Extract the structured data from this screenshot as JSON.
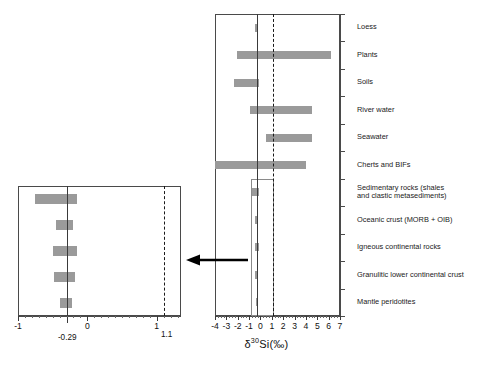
{
  "figure": {
    "axis_title_delta": "δ",
    "axis_title_sup": "30",
    "axis_title_rest": "Si(‰)"
  },
  "main_axis": {
    "ticks": [
      "-4",
      "-3",
      "-2",
      "-1",
      "0",
      "1",
      "2",
      "3",
      "4",
      "5",
      "6",
      "7"
    ],
    "tick_values": [
      -4,
      -3,
      -2,
      -1,
      0,
      1,
      2,
      3,
      4,
      5,
      6,
      7
    ],
    "xmin": -4,
    "xmax": 7,
    "solid_reference": -0.29,
    "dashed_reference": 1.1
  },
  "inset_axis": {
    "ticks": [
      "-1",
      "0",
      "1"
    ],
    "tick_values": [
      -1,
      0,
      1
    ],
    "xmin": -1.0,
    "xmax": 1.35,
    "solid_reference": -0.29,
    "dashed_reference": 1.1,
    "solid_label": "-0.29",
    "dashed_label": "1.1"
  },
  "categories": [
    "Loess",
    "Plants",
    "Soils",
    "River water",
    "Seawater",
    "Cherts and BIFs",
    "Sedimentary rocks (shales\nand clastic metasediments)",
    "Oceanic crust (MORB + OIB)",
    "Igneous continental rocks",
    "Granulitic lower continental crust",
    "Mantle peridotites"
  ],
  "colors": {
    "bar_fill": "#9a9a9a",
    "axis": "#4a4a4a",
    "reference_solid": "#3a3a3a",
    "reference_dashed": "#1a1a1a",
    "text": "#1a1a1a",
    "background": "#ffffff"
  },
  "chart_data": {
    "type": "bar",
    "orientation": "horizontal-range",
    "title": "",
    "xlabel": "δ30Si(‰)",
    "ylabel": "",
    "xlim": [
      -4,
      7
    ],
    "grid": false,
    "legend": false,
    "reference_lines": [
      {
        "value": -0.29,
        "style": "solid",
        "label": "-0.29"
      },
      {
        "value": 1.1,
        "style": "dashed",
        "label": "1.1"
      }
    ],
    "categories": [
      "Loess",
      "Plants",
      "Soils",
      "River water",
      "Seawater",
      "Cherts and BIFs",
      "Sedimentary rocks (shales and clastic metasediments)",
      "Oceanic crust (MORB + OIB)",
      "Igneous continental rocks",
      "Granulitic lower continental crust",
      "Mantle peridotites"
    ],
    "ranges": [
      {
        "category": "Loess",
        "min": -0.45,
        "max": -0.25
      },
      {
        "category": "Plants",
        "min": -2.1,
        "max": 6.2
      },
      {
        "category": "Soils",
        "min": -2.3,
        "max": -0.1
      },
      {
        "category": "River water",
        "min": -0.95,
        "max": 4.5
      },
      {
        "category": "Seawater",
        "min": 0.45,
        "max": 4.5
      },
      {
        "category": "Cherts and BIFs",
        "min": -4.0,
        "max": 4.0
      },
      {
        "category": "Sedimentary rocks (shales and clastic metasediments)",
        "min": -0.75,
        "max": -0.15
      },
      {
        "category": "Oceanic crust (MORB + OIB)",
        "min": -0.45,
        "max": -0.2
      },
      {
        "category": "Igneous continental rocks",
        "min": -0.5,
        "max": -0.15
      },
      {
        "category": "Granulitic lower continental crust",
        "min": -0.48,
        "max": -0.18
      },
      {
        "category": "Mantle peridotites",
        "min": -0.4,
        "max": -0.22
      }
    ],
    "inset": {
      "type": "bar",
      "orientation": "horizontal-range",
      "xlim": [
        -1.0,
        1.35
      ],
      "description": "Magnified view of the five lowest categories",
      "categories": [
        "Sedimentary rocks (shales and clastic metasediments)",
        "Oceanic crust (MORB + OIB)",
        "Igneous continental rocks",
        "Granulitic lower continental crust",
        "Mantle peridotites"
      ],
      "ranges": [
        {
          "category": "Sedimentary rocks (shales and clastic metasediments)",
          "min": -0.75,
          "max": -0.15
        },
        {
          "category": "Oceanic crust (MORB + OIB)",
          "min": -0.45,
          "max": -0.2
        },
        {
          "category": "Igneous continental rocks",
          "min": -0.5,
          "max": -0.15
        },
        {
          "category": "Granulitic lower continental crust",
          "min": -0.48,
          "max": -0.18
        },
        {
          "category": "Mantle peridotites",
          "min": -0.4,
          "max": -0.22
        }
      ]
    }
  }
}
